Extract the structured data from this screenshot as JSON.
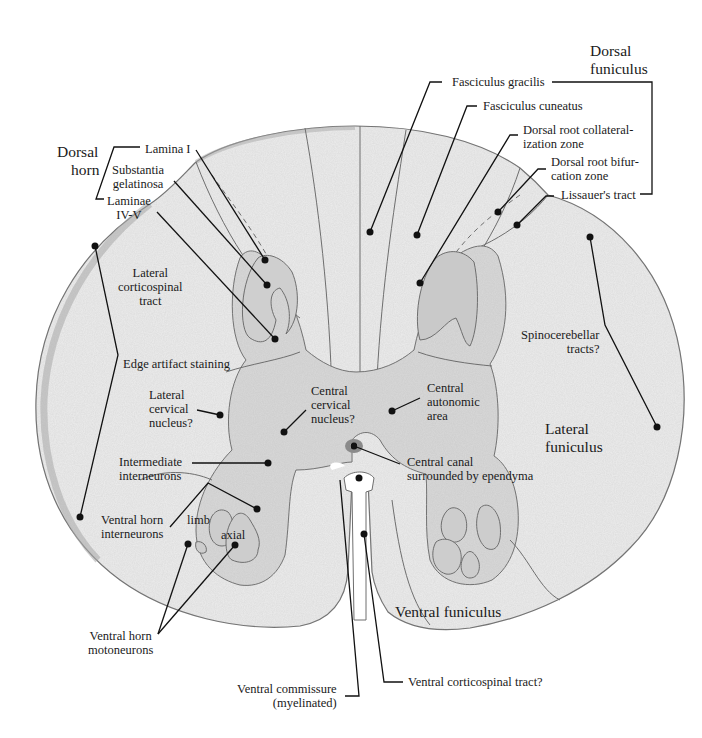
{
  "figure": {
    "type": "annotated histology diagram"
  },
  "groups": {
    "dorsal_horn": [
      "Dorsal",
      "horn"
    ],
    "dorsal_funiculus": [
      "Dorsal",
      "funiculus"
    ]
  },
  "labels": {
    "lamina_i": [
      "Lamina I"
    ],
    "substantia_gelatinosa": [
      "Substantia",
      "gelatinosa"
    ],
    "laminae_iv_v": [
      "Laminae",
      "IV-V"
    ],
    "lateral_corticospinal": [
      "Lateral",
      "corticospinal",
      "tract"
    ],
    "edge_artifact": [
      "Edge artifact staining"
    ],
    "lateral_cervical": [
      "Lateral",
      "cervical",
      "nucleus?"
    ],
    "central_cervical": [
      "Central",
      "cervical",
      "nucleus?"
    ],
    "central_autonomic": [
      "Central",
      "autonomic",
      "area"
    ],
    "central_canal": [
      "Central canal",
      "surrounded by ependyma"
    ],
    "intermediate_interneurons": [
      "Intermediate",
      "interneurons"
    ],
    "ventral_horn_interneurons": [
      "Ventral horn",
      "interneurons"
    ],
    "limb": [
      "limb"
    ],
    "axial": [
      "axial"
    ],
    "ventral_horn_motoneurons": [
      "Ventral horn",
      "motoneurons"
    ],
    "ventral_commissure": [
      "Ventral commissure",
      "(myelinated)"
    ],
    "ventral_corticospinal": [
      "Ventral corticospinal tract?"
    ],
    "ventral_funiculus": [
      "Ventral funiculus"
    ],
    "lateral_funiculus": [
      "Lateral",
      "funiculus"
    ],
    "spinocerebellar": [
      "Spinocerebellar",
      "tracts?"
    ],
    "fasciculus_gracilis": [
      "Fasciculus gracilis"
    ],
    "fasciculus_cuneatus": [
      "Fasciculus cuneatus"
    ],
    "dorsal_root_collateralization": [
      "Dorsal root collateral-",
      "ization zone"
    ],
    "dorsal_root_bifurcation": [
      "Dorsal root bifur-",
      "cation zone"
    ],
    "lissauer": [
      "Lissauer's tract"
    ]
  },
  "colors": {
    "tissue_fill": "#ececec",
    "tissue_stroke": "#6e6e6e",
    "gray_matter": "#d9d9d9",
    "edge_stain": "#a8a8a8",
    "leader_line": "#111111",
    "text": "#1a1a1a"
  }
}
